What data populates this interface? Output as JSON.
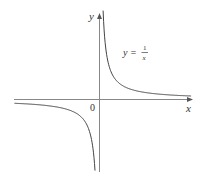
{
  "chart_data": {
    "type": "line",
    "title": "",
    "function": "y = 1/x",
    "xlabel": "x",
    "ylabel": "y",
    "origin_label": "0",
    "annotation": {
      "lhs": "y =",
      "numerator": "1",
      "denominator": "x"
    },
    "series": [
      {
        "name": "y = 1/x (x>0)",
        "x": [
          0.1,
          0.2,
          0.5,
          1,
          2,
          4,
          6
        ],
        "y": [
          10,
          5,
          2,
          1,
          0.5,
          0.25,
          0.1667
        ]
      },
      {
        "name": "y = 1/x (x<0)",
        "x": [
          -6,
          -4,
          -2,
          -1,
          -0.5,
          -0.2,
          -0.1
        ],
        "y": [
          -0.1667,
          -0.25,
          -0.5,
          -1,
          -2,
          -5,
          -10
        ]
      }
    ],
    "grid": false,
    "legend": "none",
    "color": "#333333"
  }
}
